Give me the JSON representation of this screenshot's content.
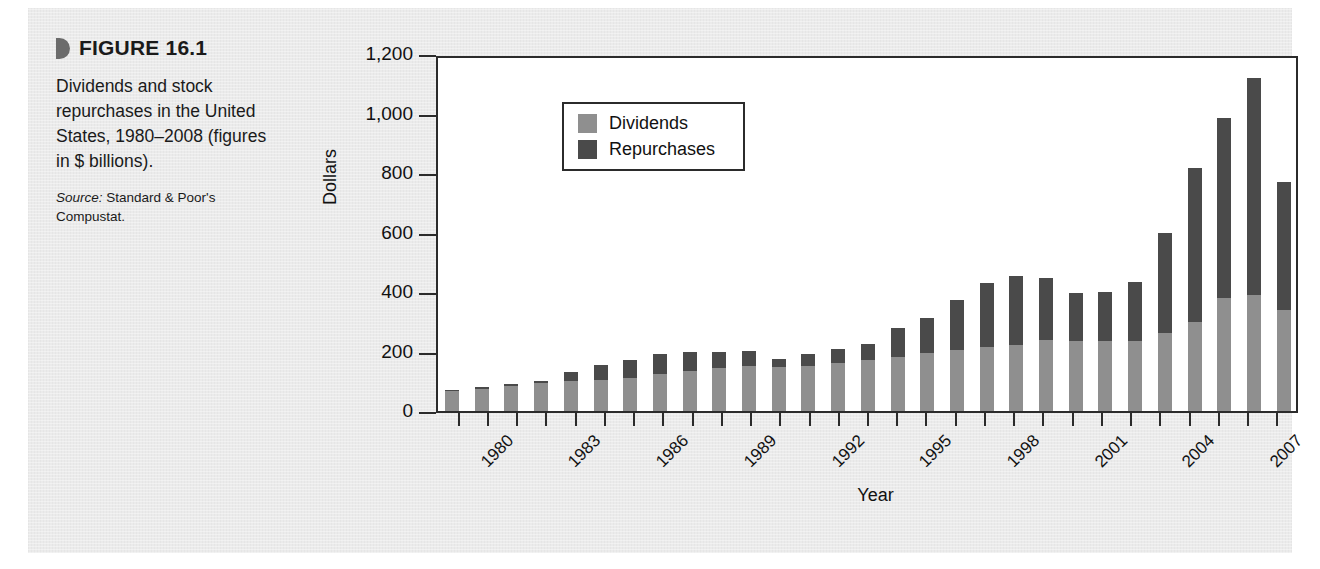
{
  "figure": {
    "number_label": "FIGURE 16.1",
    "description": "Dividends and stock repurchases in the United States, 1980–2008 (figures in $ billions).",
    "source_label": "Source:",
    "source_text": "Standard & Poor's Compustat."
  },
  "colors": {
    "dividends": "#8f8f8f",
    "repurchases": "#4a4a4a",
    "axis": "#2b2b2b",
    "page_background": "#ebebeb",
    "plot_background": "#ffffff"
  },
  "chart_data": {
    "type": "bar",
    "stacked": true,
    "title": "",
    "xlabel": "Year",
    "ylabel": "Dollars",
    "ylim": [
      0,
      1200
    ],
    "yticks": [
      0,
      200,
      400,
      600,
      800,
      1000,
      1200
    ],
    "ytick_labels": [
      "0",
      "200",
      "400",
      "600",
      "800",
      "1,000",
      "1,200"
    ],
    "grid": false,
    "legend_position": "upper-left-inside",
    "categories": [
      "1980",
      "1981",
      "1982",
      "1983",
      "1984",
      "1985",
      "1986",
      "1987",
      "1988",
      "1989",
      "1990",
      "1991",
      "1992",
      "1993",
      "1994",
      "1995",
      "1996",
      "1997",
      "1998",
      "1999",
      "2000",
      "2001",
      "2002",
      "2003",
      "2004",
      "2005",
      "2006",
      "2007",
      "2008"
    ],
    "xtick_labels_shown": [
      "1980",
      "1983",
      "1986",
      "1989",
      "1992",
      "1995",
      "1998",
      "2001",
      "2004",
      "2007"
    ],
    "series": [
      {
        "name": "Dividends",
        "color": "#8f8f8f",
        "values": [
          66,
          74,
          84,
          94,
          100,
          104,
          110,
          126,
          136,
          144,
          150,
          148,
          152,
          160,
          170,
          182,
          196,
          206,
          214,
          222,
          238,
          236,
          236,
          234,
          262,
          300,
          380,
          390,
          338
        ]
      },
      {
        "name": "Repurchases",
        "color": "#4a4a4a",
        "values": [
          6,
          6,
          8,
          8,
          32,
          50,
          60,
          64,
          62,
          56,
          52,
          28,
          38,
          50,
          54,
          96,
          118,
          166,
          216,
          232,
          210,
          162,
          164,
          200,
          338,
          518,
          604,
          728,
          432
        ]
      }
    ],
    "totals": [
      72,
      80,
      92,
      102,
      132,
      154,
      170,
      190,
      198,
      200,
      202,
      176,
      190,
      210,
      224,
      278,
      314,
      372,
      430,
      454,
      448,
      398,
      400,
      434,
      600,
      818,
      984,
      1118,
      770
    ]
  },
  "legend": {
    "entries": [
      {
        "label": "Dividends",
        "color": "#8f8f8f"
      },
      {
        "label": "Repurchases",
        "color": "#4a4a4a"
      }
    ]
  }
}
